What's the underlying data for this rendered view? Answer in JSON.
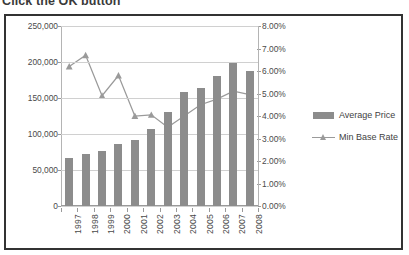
{
  "page": {
    "heading": "Click the OK button"
  },
  "legend": {
    "position": "right",
    "items": [
      {
        "label": "Average Price",
        "marker": "bar-swatch",
        "color": "#8c8c8c"
      },
      {
        "label": "Min Base Rate",
        "marker": "line-triangle",
        "color": "#9a9a9a"
      }
    ]
  },
  "colors": {
    "bar": "#8c8c8c",
    "line": "#9a9a9a",
    "gridline": "#d0d0d0",
    "axis": "#9a9a9a",
    "frame_border": "#333333",
    "tick_text": "#4a4a4a",
    "background": "#ffffff"
  },
  "chart_data": {
    "type": "bar",
    "title": "",
    "subtitle": "",
    "xlabel": "",
    "ylabel": "",
    "grid": true,
    "legend_position": "right",
    "categories": [
      "1997",
      "1998",
      "1999",
      "2000",
      "2001",
      "2002",
      "2003",
      "2004",
      "2005",
      "2006",
      "2007",
      "2008"
    ],
    "axes": {
      "left": {
        "label": "",
        "ylim": [
          0,
          250000
        ],
        "ticks": [
          0,
          50000,
          100000,
          150000,
          200000,
          250000
        ],
        "tick_labels": [
          "0",
          "50,000",
          "100,000",
          "150,000",
          "200,000",
          "250,000"
        ],
        "series": "Average Price"
      },
      "right": {
        "label": "",
        "ylim": [
          0,
          0.08
        ],
        "ticks": [
          0,
          0.01,
          0.02,
          0.03,
          0.04,
          0.05,
          0.06,
          0.07,
          0.08
        ],
        "tick_labels": [
          "0.00%",
          "1.00%",
          "2.00%",
          "3.00%",
          "4.00%",
          "5.00%",
          "6.00%",
          "7.00%",
          "8.00%"
        ],
        "series": "Min Base Rate"
      }
    },
    "series": [
      {
        "name": "Average Price",
        "type": "bar",
        "axis": "left",
        "color": "#8c8c8c",
        "values": [
          67000,
          72500,
          76000,
          85500,
          91500,
          107000,
          130000,
          158500,
          164500,
          181000,
          199000,
          188000
        ]
      },
      {
        "name": "Min Base Rate",
        "type": "line",
        "axis": "right",
        "color": "#9a9a9a",
        "marker": "triangle",
        "values": [
          6.2,
          6.7,
          4.9,
          5.8,
          4.0,
          4.05,
          3.5,
          4.0,
          4.5,
          4.75,
          5.1,
          4.95
        ],
        "value_unit": "percent"
      }
    ]
  }
}
